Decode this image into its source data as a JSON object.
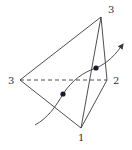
{
  "diagram": {
    "type": "pyramid-with-curve",
    "vertices": [
      {
        "id": "top",
        "label": "3",
        "x": 101,
        "y": 17,
        "label_x": 108,
        "label_y": 13
      },
      {
        "id": "left",
        "label": "3",
        "x": 20,
        "y": 80,
        "label_x": 9,
        "label_y": 84
      },
      {
        "id": "right",
        "label": "2",
        "x": 107,
        "y": 80,
        "label_x": 113,
        "label_y": 84
      },
      {
        "id": "bottom",
        "label": "1",
        "x": 81,
        "y": 128,
        "label_x": 78,
        "label_y": 141
      }
    ],
    "edges": [
      {
        "from": "top",
        "to": "left",
        "style": "solid"
      },
      {
        "from": "top",
        "to": "right",
        "style": "solid"
      },
      {
        "from": "top",
        "to": "bottom",
        "style": "solid"
      },
      {
        "from": "left",
        "to": "bottom",
        "style": "solid"
      },
      {
        "from": "right",
        "to": "bottom",
        "style": "solid"
      },
      {
        "from": "left",
        "to": "right",
        "style": "dashed"
      }
    ],
    "curve": {
      "path": "M35,125 C48,118 56,106 63,94 C72,80 84,72 96,68 C108,63 116,54 123,44",
      "arrow": "end"
    },
    "points": [
      {
        "id": "intersection-1",
        "x": 63,
        "y": 94
      },
      {
        "id": "intersection-2",
        "x": 96,
        "y": 68
      }
    ],
    "colors": {
      "line": "#3a3a3a",
      "dot": "#1a1a2e",
      "label": "#333333",
      "background": "#ffffff"
    }
  }
}
